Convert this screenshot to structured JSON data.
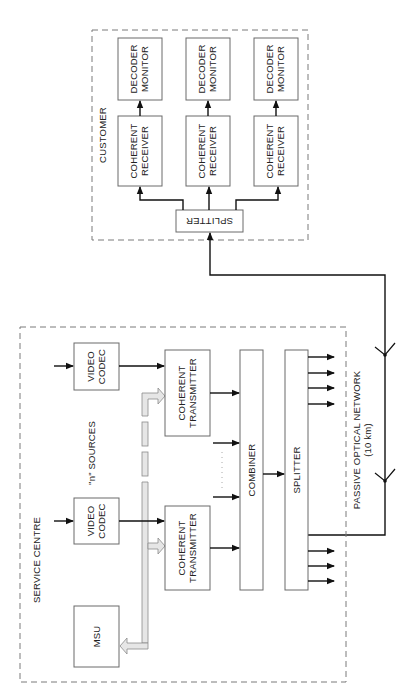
{
  "diagram": {
    "orientation": "rotated 90 degrees counter-clockwise",
    "groups": {
      "service_centre": {
        "label": "SERVICE CENTRE"
      },
      "customer": {
        "label": "CUSTOMER"
      }
    },
    "service_centre": {
      "msu": "MSU",
      "video_codec_1": "VIDEO CODEC",
      "video_codec_2": "VIDEO CODEC",
      "coherent_transmitter_1": "COHERENT TRANSMITTER",
      "coherent_transmitter_2": "COHERENT TRANSMITTER",
      "n_sources": "\"n\" SOURCES",
      "combiner": "COMBINER",
      "splitter": "SPLITTER"
    },
    "network": {
      "label": "PASSIVE OPTICAL NETWORK",
      "distance": "(10 km)"
    },
    "customer": {
      "splitter": "SPLITTER",
      "receivers": [
        {
          "receiver": "COHERENT RECEIVER",
          "monitor": "DECODER MONITOR"
        },
        {
          "receiver": "COHERENT RECEIVER",
          "monitor": "DECODER MONITOR"
        },
        {
          "receiver": "COHERENT RECEIVER",
          "monitor": "DECODER MONITOR"
        }
      ]
    },
    "colors": {
      "line": "#111111",
      "box_border": "#6a6a6a",
      "bus_fill": "#e6e6e6",
      "dashed_border": "#7a7a7a"
    }
  }
}
